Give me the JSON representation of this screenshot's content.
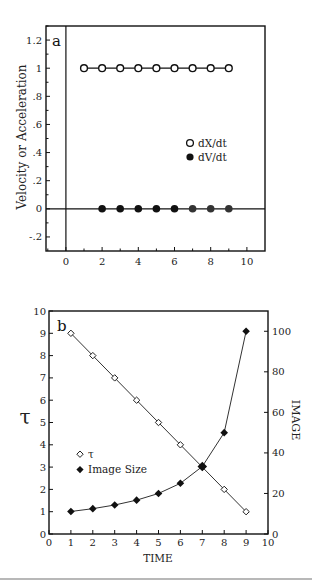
{
  "chart_data": [
    {
      "id": "a",
      "type": "scatter",
      "panel_label": "a",
      "title": "",
      "xlabel": "",
      "ylabel": "Velocity or Acceleration",
      "xlim": [
        -1.1,
        11
      ],
      "ylim": [
        -0.3,
        1.3
      ],
      "x_ticks": [
        0,
        2,
        4,
        6,
        8,
        10
      ],
      "x_tick_labels": [
        "0",
        "2",
        "4",
        "6",
        "8",
        "10"
      ],
      "y_ticks": [
        -0.2,
        0,
        0.2,
        0.4,
        0.6,
        0.8,
        1,
        1.2
      ],
      "y_tick_labels": [
        "-.2",
        "0",
        ".2",
        ".4",
        ".6",
        ".8",
        "1",
        "1.2"
      ],
      "grid": false,
      "reference_lines": {
        "x": 0,
        "y": 0
      },
      "legend_position": "right-middle",
      "series": [
        {
          "name": "dX/dt",
          "marker": "open-circle",
          "line": true,
          "x": [
            1,
            2,
            3,
            4,
            5,
            6,
            7,
            8,
            9
          ],
          "y": [
            1,
            1,
            1,
            1,
            1,
            1,
            1,
            1,
            1
          ]
        },
        {
          "name": "dV/dt",
          "marker": "filled-circle",
          "line": false,
          "x": [
            2,
            3,
            4,
            5,
            6,
            7,
            8,
            9
          ],
          "y": [
            0,
            0,
            0,
            0,
            0,
            0,
            0,
            0
          ]
        }
      ]
    },
    {
      "id": "b",
      "type": "line",
      "panel_label": "b",
      "title": "",
      "xlabel": "TIME",
      "ylabel": "τ",
      "ylabel_right": "IMAGE",
      "xlim": [
        0,
        10
      ],
      "ylim": [
        0,
        10
      ],
      "ylim_right": [
        0,
        110
      ],
      "x_ticks": [
        0,
        1,
        2,
        3,
        4,
        5,
        6,
        7,
        8,
        9,
        10
      ],
      "x_tick_labels": [
        "0",
        "1",
        "2",
        "3",
        "4",
        "5",
        "6",
        "7",
        "8",
        "9",
        "10"
      ],
      "y_ticks": [
        0,
        1,
        2,
        3,
        4,
        5,
        6,
        7,
        8,
        9,
        10
      ],
      "y_tick_labels": [
        "0",
        "1",
        "2",
        "3",
        "4",
        "5",
        "6",
        "7",
        "8",
        "9",
        "10"
      ],
      "y_ticks_right": [
        0,
        20,
        40,
        60,
        80,
        100
      ],
      "y_tick_labels_right": [
        "0",
        "20",
        "40",
        "60",
        "80",
        "100"
      ],
      "grid": false,
      "legend_position": "left-middle",
      "series": [
        {
          "name": "τ",
          "marker": "open-diamond",
          "axis": "left",
          "x": [
            1,
            2,
            3,
            4,
            5,
            6,
            7,
            8,
            9
          ],
          "y": [
            9,
            8,
            7,
            6,
            5,
            4,
            3,
            2,
            1
          ]
        },
        {
          "name": "Image Size",
          "marker": "filled-diamond",
          "axis": "right",
          "x": [
            1,
            2,
            3,
            4,
            5,
            6,
            7,
            8,
            9
          ],
          "y": [
            11.1,
            12.5,
            14.3,
            16.7,
            20,
            25,
            33.3,
            50,
            100
          ]
        }
      ]
    }
  ],
  "colors": {
    "ink": "#111111",
    "marker_gray": "#333333",
    "rule": "#b8b8b8"
  }
}
